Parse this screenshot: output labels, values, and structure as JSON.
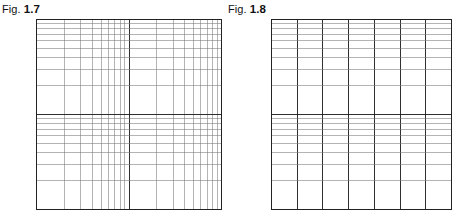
{
  "page": {
    "background": "#ffffff",
    "width": 459,
    "height": 223
  },
  "figures": [
    {
      "id": "fig-1-7",
      "caption_word": "Fig.",
      "caption_number": "1.7",
      "caption_x": 2,
      "caption_y": 3,
      "grid": {
        "x": 36,
        "y": 19,
        "width": 186,
        "height": 191,
        "paper_type": "log-log",
        "x_scale": "log",
        "y_scale": "log",
        "x_cycles": 2,
        "y_cycles": 2,
        "minor_color": "#777777",
        "major_color": "#1a1a1a",
        "border_color": "#222222",
        "minor_width": 0.55,
        "major_width": 0.9,
        "border_width": 1.0
      }
    },
    {
      "id": "fig-1-8",
      "caption_word": "Fig.",
      "caption_number": "1.8",
      "caption_x": 228,
      "caption_y": 3,
      "grid": {
        "x": 271,
        "y": 19,
        "width": 181,
        "height": 191,
        "paper_type": "semi-log",
        "x_scale": "linear",
        "y_scale": "log",
        "x_divisions": 7,
        "y_cycles": 2,
        "minor_color": "#777777",
        "major_color": "#1a1a1a",
        "border_color": "#222222",
        "minor_width": 0.55,
        "major_width": 0.9,
        "border_width": 1.0
      }
    }
  ],
  "chart_data": {
    "type": "table",
    "plots": [
      {
        "name": "Fig. 1.7",
        "paper": "log-log graph paper",
        "x_axis": {
          "scale": "log",
          "cycles": 2,
          "decade_mantissas": [
            1,
            2,
            3,
            4,
            5,
            6,
            7,
            8,
            9
          ],
          "gridlines_per_cycle": 9
        },
        "y_axis": {
          "scale": "log",
          "cycles": 2,
          "decade_mantissas": [
            1,
            2,
            3,
            4,
            5,
            6,
            7,
            8,
            9
          ],
          "gridlines_per_cycle": 9
        },
        "data_series": [],
        "grid": true,
        "legend": "none"
      },
      {
        "name": "Fig. 1.8",
        "paper": "semi-logarithmic graph paper",
        "x_axis": {
          "scale": "linear",
          "divisions": 7,
          "ticks": [
            0,
            1,
            2,
            3,
            4,
            5,
            6,
            7
          ]
        },
        "y_axis": {
          "scale": "log",
          "cycles": 2,
          "decade_mantissas": [
            1,
            2,
            3,
            4,
            5,
            6,
            7,
            8,
            9
          ],
          "gridlines_per_cycle": 9
        },
        "data_series": [],
        "grid": true,
        "legend": "none"
      }
    ]
  }
}
